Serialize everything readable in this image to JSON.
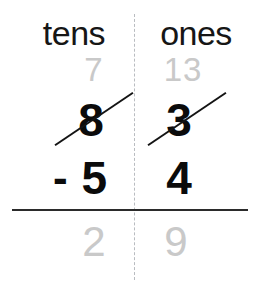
{
  "worksheet": {
    "type": "subtraction-with-regrouping",
    "columns": {
      "tens_header": "tens",
      "ones_header": "ones"
    },
    "regroup_row": {
      "tens": "7",
      "ones": "13"
    },
    "minuend_row": {
      "tens": "8",
      "ones": "3",
      "tens_struck_out": true,
      "ones_struck_out": true
    },
    "subtrahend_row": {
      "operator": "-",
      "tens": "5",
      "ones": "4"
    },
    "answer_row": {
      "tens": "2",
      "ones": "9"
    },
    "colors": {
      "ink": "#0b0b0b",
      "faint_ink": "#c9c9c9",
      "rule": "#2b2b2b",
      "divider": "#b9bcc0",
      "background": "#ffffff"
    }
  }
}
